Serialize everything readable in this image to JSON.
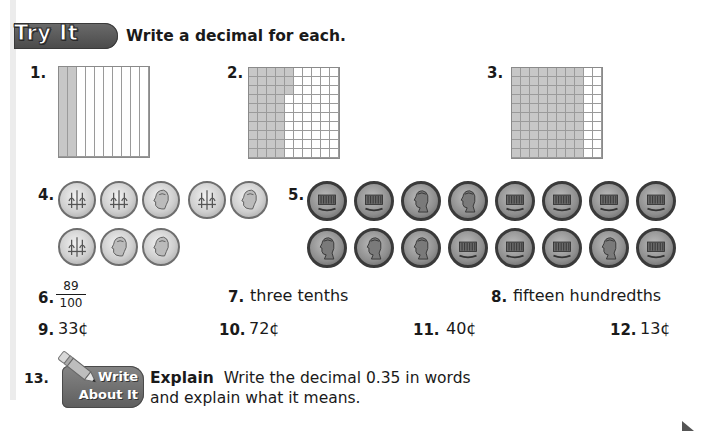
{
  "header": {
    "badge": "Try It",
    "instruction": "Write a decimal for each."
  },
  "items": [
    {
      "number": "1.",
      "type": "tenths-grid",
      "shaded_columns": 2
    },
    {
      "number": "2.",
      "type": "hundredths-grid",
      "shaded_full_columns": 4,
      "extra_shaded_cells": 3
    },
    {
      "number": "3.",
      "type": "hundredths-grid",
      "shaded_full_columns": 8,
      "extra_shaded_cells": 0
    },
    {
      "number": "4.",
      "type": "coins",
      "coin": "dime",
      "rows": [
        [
          "back",
          "back",
          "front",
          "back",
          "front"
        ],
        [
          "back",
          "front",
          "front"
        ]
      ]
    },
    {
      "number": "5.",
      "type": "coins",
      "coin": "penny",
      "rows": [
        [
          "back",
          "back",
          "front",
          "front",
          "back",
          "back",
          "back",
          "back"
        ],
        [
          "front",
          "front",
          "front",
          "back",
          "back",
          "back",
          "front",
          "back"
        ]
      ]
    },
    {
      "number": "6.",
      "type": "fraction",
      "numerator": "89",
      "denominator": "100"
    },
    {
      "number": "7.",
      "type": "words",
      "text": "three tenths"
    },
    {
      "number": "8.",
      "type": "words",
      "text": "fifteen hundredths"
    },
    {
      "number": "9.",
      "type": "money",
      "text": "33¢"
    },
    {
      "number": "10.",
      "type": "money",
      "text": "72¢"
    },
    {
      "number": "11.",
      "type": "money",
      "text": "40¢"
    },
    {
      "number": "12.",
      "type": "money",
      "text": "13¢"
    }
  ],
  "write_about_it": {
    "number": "13.",
    "badge_line1": "Write",
    "badge_line2": "About It",
    "lead": "Explain",
    "line1": "Write the decimal 0.35 in words",
    "line2": "and explain what it means."
  },
  "colors": {
    "badge": "#555555",
    "shaded": "#c7c7c7",
    "grid_line": "#9a9a9a"
  }
}
